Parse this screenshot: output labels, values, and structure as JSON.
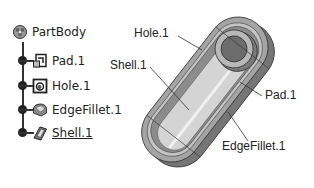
{
  "tree": {
    "root": {
      "label": "PartBody",
      "icon": "partbody-icon"
    },
    "items": [
      {
        "label": "Pad.1",
        "icon": "pad-icon",
        "active": false
      },
      {
        "label": "Hole.1",
        "icon": "hole-icon",
        "active": false
      },
      {
        "label": "EdgeFillet.1",
        "icon": "edgefillet-icon",
        "active": false
      },
      {
        "label": "Shell.1",
        "icon": "shell-icon",
        "active": true
      }
    ]
  },
  "diagram": {
    "callouts": [
      {
        "label": "Hole.1"
      },
      {
        "label": "Shell.1"
      },
      {
        "label": "Pad.1"
      },
      {
        "label": "EdgeFillet.1"
      }
    ],
    "colors": {
      "body_dark": "#7a7a7a",
      "body_mid": "#9a9a9a",
      "body_light": "#c8c8c8",
      "inner_floor": "#d6d6d6",
      "outline": "#333333"
    }
  }
}
